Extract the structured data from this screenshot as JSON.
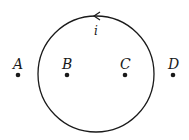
{
  "diagram": {
    "loop": {
      "cx": 96,
      "cy": 74,
      "r": 58,
      "color": "#1a1a1a",
      "current_direction": "counterclockwise"
    },
    "current_label": "i",
    "points": [
      {
        "label": "A",
        "x": 18,
        "y": 75
      },
      {
        "label": "B",
        "x": 67,
        "y": 75
      },
      {
        "label": "C",
        "x": 125,
        "y": 75
      },
      {
        "label": "D",
        "x": 173,
        "y": 75
      }
    ]
  }
}
